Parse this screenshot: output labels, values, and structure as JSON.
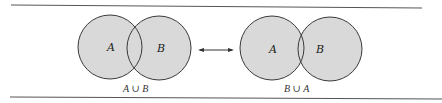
{
  "figure": {
    "left_diagram": {
      "circle_a_label": "A",
      "circle_b_label": "B",
      "caption": "A ∪ B"
    },
    "right_diagram": {
      "circle_a_label": "A",
      "circle_b_label": "B",
      "caption": "B ∪ A"
    },
    "relation": "double-arrow",
    "colors": {
      "fill": "#d8d8d8",
      "stroke": "#3a3a3a",
      "rule": "#555555"
    }
  }
}
